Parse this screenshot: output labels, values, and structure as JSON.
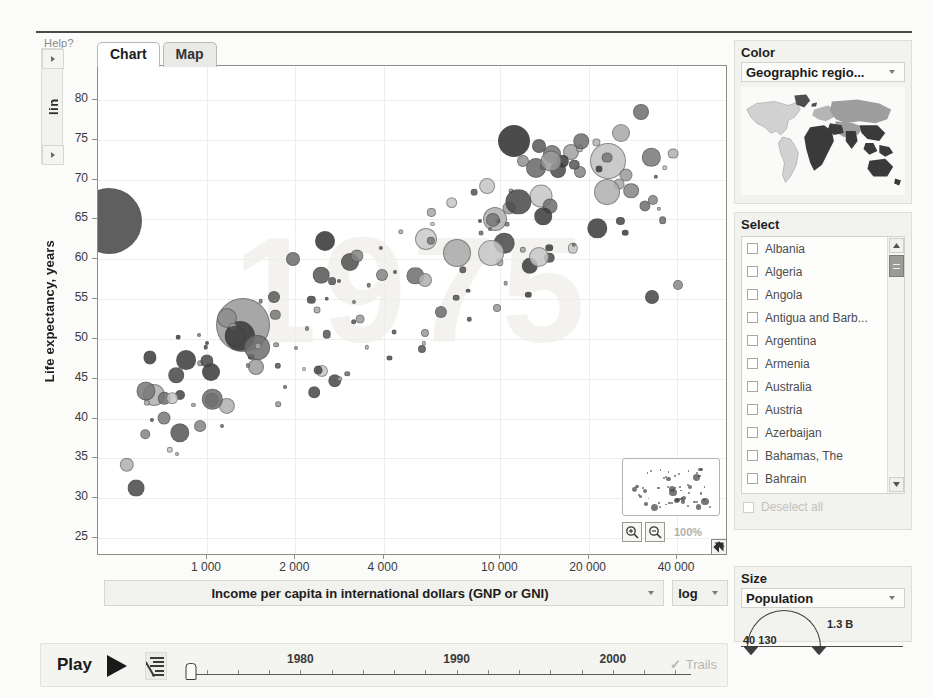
{
  "app": {
    "help_label": "Help?",
    "y_scale_mode": "lin",
    "x_scale_mode": "log",
    "watermark_year": "1975"
  },
  "tabs": [
    {
      "label": "Chart",
      "active": true
    },
    {
      "label": "Map",
      "active": false
    }
  ],
  "axes": {
    "y_title": "Life expectancy, years",
    "x_title": "Income per capita in international dollars (GNP or GNI)",
    "y_ticks": [
      "80",
      "75",
      "70",
      "65",
      "60",
      "55",
      "50",
      "45",
      "40",
      "35",
      "30",
      "25"
    ],
    "x_ticks": [
      "1 000",
      "2 000",
      "4 000",
      "10 000",
      "20 000",
      "40 000"
    ]
  },
  "zoom_controls": {
    "zoom_in_icon": "magnifier-plus-icon",
    "zoom_out_icon": "magnifier-minus-icon",
    "zoom_percent": "100%",
    "resize_icon": "resize-handle-icon"
  },
  "color_panel": {
    "title": "Color",
    "selected": "Geographic regio...",
    "legend_icon": "world-map-legend"
  },
  "select_panel": {
    "title": "Select",
    "countries": [
      "Albania",
      "Algeria",
      "Angola",
      "Antigua and Barb...",
      "Argentina",
      "Armenia",
      "Australia",
      "Austria",
      "Azerbaijan",
      "Bahamas, The",
      "Bahrain",
      "Bangladesh",
      "Belarus"
    ],
    "deselect_label": "Deselect all"
  },
  "size_panel": {
    "title": "Size",
    "selected": "Population",
    "min_label": "40 130",
    "max_label": "1.3 B"
  },
  "timeline": {
    "play_label": "Play",
    "play_icon": "play-triangle-icon",
    "speed_icon": "speed-control-icon",
    "years": [
      "1980",
      "1990",
      "2000"
    ],
    "trails_label": "Trails",
    "trails_checked": true
  },
  "chart_data": {
    "type": "scatter",
    "xlabel": "Income per capita in international dollars (GNP or GNI)",
    "ylabel": "Life expectancy, years",
    "xscale": "log",
    "yscale": "linear",
    "xlim": [
      400,
      60000
    ],
    "ylim": [
      22,
      83
    ],
    "xticks": [
      1000,
      2000,
      4000,
      10000,
      20000,
      40000
    ],
    "yticks": [
      25,
      30,
      35,
      40,
      45,
      50,
      55,
      60,
      65,
      70,
      75,
      80
    ],
    "grid": true,
    "legend": "Geographic region (color), Population (size)",
    "size_encoding": "Population",
    "color_encoding": "Geographic region",
    "points": [
      {
        "x": 1.8,
        "y": 64.8,
        "r": 33,
        "c": "#4a4a4a"
      },
      {
        "x": 23.0,
        "y": 51.8,
        "r": 27,
        "c": "#9c9c9c"
      },
      {
        "x": 22.5,
        "y": 50.4,
        "r": 15,
        "c": "#3d3d3d"
      },
      {
        "x": 20.5,
        "y": 52.6,
        "r": 10,
        "c": "#8e8e8e"
      },
      {
        "x": 66.0,
        "y": 74.8,
        "r": 16,
        "c": "#333333"
      },
      {
        "x": 81.0,
        "y": 72.3,
        "r": 18,
        "c": "#c3c3c3"
      },
      {
        "x": 72.0,
        "y": 73.2,
        "r": 9,
        "c": "#777777"
      },
      {
        "x": 70.0,
        "y": 74.2,
        "r": 7,
        "c": "#5d5d5d"
      },
      {
        "x": 75.0,
        "y": 73.5,
        "r": 8,
        "c": "#a5a5a5"
      },
      {
        "x": 69.5,
        "y": 71.5,
        "r": 10,
        "c": "#6d6d6d"
      },
      {
        "x": 73.0,
        "y": 71.2,
        "r": 8,
        "c": "#4f4f4f"
      },
      {
        "x": 76.5,
        "y": 71.0,
        "r": 6,
        "c": "#888888"
      },
      {
        "x": 67.5,
        "y": 72.4,
        "r": 6,
        "c": "#959595"
      },
      {
        "x": 63.0,
        "y": 65.0,
        "r": 12,
        "c": "#b2b2b2"
      },
      {
        "x": 57.0,
        "y": 60.8,
        "r": 14,
        "c": "#ababab"
      },
      {
        "x": 52.0,
        "y": 62.5,
        "r": 11,
        "c": "#cccccc"
      },
      {
        "x": 40.0,
        "y": 59.6,
        "r": 9,
        "c": "#555555"
      },
      {
        "x": 36.0,
        "y": 62.3,
        "r": 10,
        "c": "#3a3a3a"
      },
      {
        "x": 31.0,
        "y": 60.0,
        "r": 7,
        "c": "#707070"
      },
      {
        "x": 45.0,
        "y": 58.0,
        "r": 6,
        "c": "#8a8a8a"
      },
      {
        "x": 28.0,
        "y": 55.2,
        "r": 6,
        "c": "#606060"
      },
      {
        "x": 25.0,
        "y": 46.5,
        "r": 8,
        "c": "#a0a0a0"
      },
      {
        "x": 18.0,
        "y": 45.8,
        "r": 9,
        "c": "#3f3f3f"
      },
      {
        "x": 13.0,
        "y": 43.0,
        "r": 5,
        "c": "#4a4a4a"
      },
      {
        "x": 88.0,
        "y": 55.2,
        "r": 7,
        "c": "#4a4a4a"
      },
      {
        "x": 92.0,
        "y": 56.8,
        "r": 5,
        "c": "#8c8c8c"
      }
    ]
  }
}
